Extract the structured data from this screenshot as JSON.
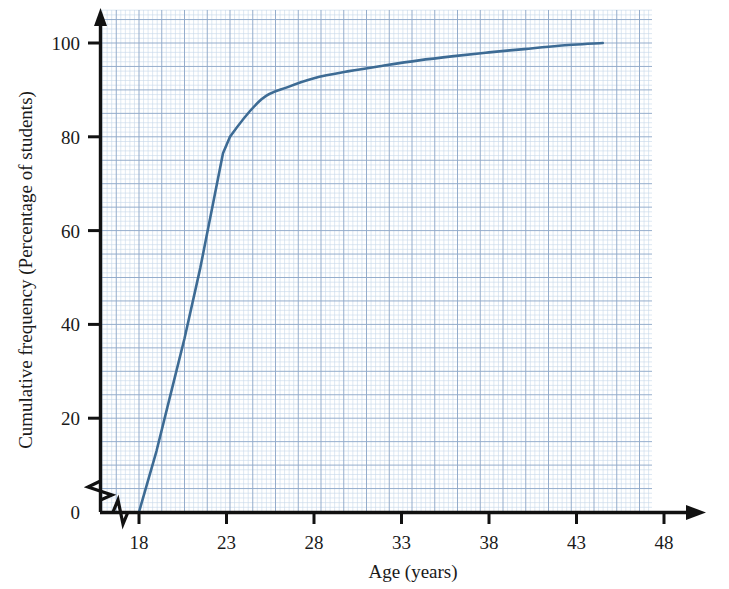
{
  "chart_data": {
    "type": "line",
    "title": "",
    "xlabel": "Age (years)",
    "ylabel": "Cumulative frequency (Percentage of students)",
    "xlim": [
      17,
      50
    ],
    "ylim": [
      0,
      108
    ],
    "x_ticks": [
      18,
      23,
      28,
      33,
      38,
      43,
      48
    ],
    "x_tick_labels": [
      "18",
      "23",
      "28",
      "33",
      "38",
      "43",
      "48"
    ],
    "y_ticks": [
      0,
      20,
      40,
      60,
      80,
      100
    ],
    "y_tick_labels": [
      "0",
      "20",
      "40",
      "60",
      "80",
      "100"
    ],
    "grid": true,
    "grid_minor_step_x": 0.26,
    "grid_minor_step_y": 1,
    "grid_major_step_x": 1.3,
    "grid_major_step_y": 5,
    "legend": "none",
    "axis_break_x": true,
    "axis_break_y": true,
    "series": [
      {
        "name": "Cumulative frequency",
        "color": "#3d6b94",
        "points": [
          {
            "x": 18.0,
            "y": 0
          },
          {
            "x": 19.0,
            "y": 13
          },
          {
            "x": 20.0,
            "y": 28
          },
          {
            "x": 20.6,
            "y": 37
          },
          {
            "x": 21.5,
            "y": 52
          },
          {
            "x": 22.8,
            "y": 76.5
          },
          {
            "x": 23.2,
            "y": 80
          },
          {
            "x": 25.0,
            "y": 88.0
          },
          {
            "x": 26.5,
            "y": 90.6
          },
          {
            "x": 28.0,
            "y": 92.5
          },
          {
            "x": 30.0,
            "y": 94.0
          },
          {
            "x": 32.0,
            "y": 95.2
          },
          {
            "x": 34.0,
            "y": 96.3
          },
          {
            "x": 36.0,
            "y": 97.2
          },
          {
            "x": 38.0,
            "y": 98.0
          },
          {
            "x": 40.0,
            "y": 98.7
          },
          {
            "x": 42.0,
            "y": 99.4
          },
          {
            "x": 44.5,
            "y": 100.0
          }
        ]
      }
    ]
  },
  "figure": {
    "background_color": "#ffffff",
    "grid_minor_color": "#c6d6ea",
    "grid_major_color": "#8fa9c9",
    "axis_color": "#111111",
    "curve_color": "#3d6b94"
  }
}
